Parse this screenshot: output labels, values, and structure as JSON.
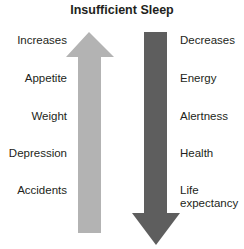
{
  "title": "Insufficient Sleep",
  "left": {
    "header": "Increases",
    "items": [
      "Appetite",
      "Weight",
      "Depression",
      "Accidents"
    ],
    "arrow_direction": "up",
    "arrow_color": "#b3b3b3"
  },
  "right": {
    "header": "Decreases",
    "items": [
      "Energy",
      "Alertness",
      "Health",
      "Life expectancy"
    ],
    "item_lines": [
      "Life",
      "expectancy"
    ],
    "arrow_direction": "down",
    "arrow_color": "#5e5e5e"
  }
}
